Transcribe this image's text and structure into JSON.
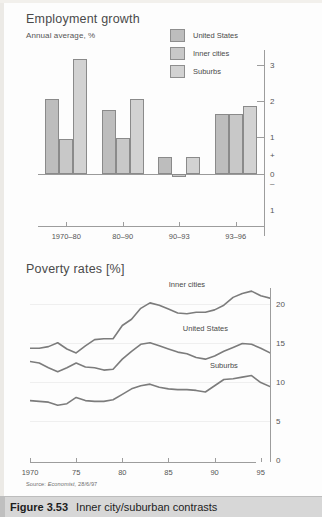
{
  "figure": {
    "number": "Figure 3.53",
    "caption": "Inner city/suburban contrasts",
    "source": "Source: Economist, 28/6/97",
    "source_prefix": "Source:",
    "source_publication": "Economist,",
    "source_date": "28/6/97"
  },
  "colors": {
    "bar_fill": "#c3c3c3",
    "bar_stroke": "#8a8a8a",
    "line_stroke": "#7c7c7c",
    "axis": "#9d9d9d",
    "text": "#4a4a4a",
    "caption_bar": "#d7d7d7"
  },
  "chart_data": [
    {
      "id": "employment-growth",
      "type": "bar",
      "title": "Employment growth",
      "subtitle": "Annual average, %",
      "xlabel": "",
      "ylabel": "",
      "categories": [
        "1970–80",
        "80–90",
        "90–93",
        "93–96"
      ],
      "ylim": [
        -1,
        3.4
      ],
      "yticks": [
        3,
        2,
        1,
        0
      ],
      "yticklabels": [
        "3",
        "2",
        "1",
        "+",
        "0",
        "–",
        "1"
      ],
      "grid": false,
      "legend_position": "top-center",
      "series": [
        {
          "name": "United States",
          "values": [
            2.05,
            1.75,
            0.45,
            1.65
          ]
        },
        {
          "name": "Inner cities",
          "values": [
            0.95,
            0.97,
            -0.1,
            1.65
          ]
        },
        {
          "name": "Suburbs",
          "values": [
            3.15,
            2.05,
            0.45,
            1.85
          ]
        }
      ]
    },
    {
      "id": "poverty-rates",
      "type": "line",
      "title": "Poverty rates [%]",
      "subtitle": "",
      "xlabel": "",
      "ylabel": "",
      "xlim": [
        1970,
        1996
      ],
      "ylim": [
        0,
        22
      ],
      "yticks": [
        0,
        5,
        10,
        15,
        20
      ],
      "yticklabels": [
        "0",
        "5",
        "10",
        "15",
        "20"
      ],
      "xticks": [
        1970,
        1975,
        1980,
        1985,
        1990,
        1995
      ],
      "xticklabels": [
        "1970",
        "75",
        "80",
        "85",
        "90",
        "95"
      ],
      "grid": true,
      "legend_position": "inline-labels",
      "x": [
        1970,
        1971,
        1972,
        1973,
        1974,
        1975,
        1976,
        1977,
        1978,
        1979,
        1980,
        1981,
        1982,
        1983,
        1984,
        1985,
        1986,
        1987,
        1988,
        1989,
        1990,
        1991,
        1992,
        1993,
        1994,
        1995,
        1996
      ],
      "series": [
        {
          "name": "Inner cities",
          "values": [
            14.3,
            14.3,
            14.5,
            15.0,
            14.2,
            13.7,
            14.6,
            15.4,
            15.5,
            15.5,
            17.2,
            18.0,
            19.4,
            20.1,
            19.8,
            19.3,
            18.8,
            18.7,
            18.9,
            18.9,
            19.2,
            19.8,
            20.8,
            21.3,
            21.6,
            21.0,
            20.7
          ]
        },
        {
          "name": "United States",
          "values": [
            12.6,
            12.4,
            11.8,
            11.3,
            11.8,
            12.4,
            11.9,
            11.8,
            11.5,
            11.6,
            12.9,
            13.9,
            14.8,
            15.0,
            14.6,
            14.2,
            13.8,
            13.6,
            13.1,
            12.9,
            13.3,
            13.9,
            14.4,
            14.9,
            14.8,
            14.3,
            13.7
          ]
        },
        {
          "name": "Suburbs",
          "values": [
            7.6,
            7.5,
            7.4,
            7.0,
            7.2,
            8.0,
            7.6,
            7.5,
            7.5,
            7.7,
            8.4,
            9.1,
            9.5,
            9.7,
            9.3,
            9.1,
            9.0,
            9.0,
            8.9,
            8.7,
            9.5,
            10.3,
            10.4,
            10.6,
            10.8,
            9.9,
            9.4
          ]
        }
      ],
      "annotations": [
        {
          "text": "Inner cities",
          "x": 1987,
          "y": 22.3
        },
        {
          "text": "United States",
          "x": 1989,
          "y": 16.6
        },
        {
          "text": "Suburbs",
          "x": 1991,
          "y": 11.9
        }
      ]
    }
  ]
}
